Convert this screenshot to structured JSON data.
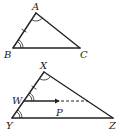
{
  "diagram": {
    "triangle1": {
      "vertices": {
        "A": "A",
        "B": "B",
        "C": "C"
      },
      "marks": {
        "angle_A": "single-arc",
        "angle_B": "double-arc",
        "side_AB": "tick"
      }
    },
    "triangle2": {
      "vertices": {
        "X": "X",
        "Y": "Y",
        "Z": "Z"
      },
      "points": {
        "W": "W",
        "P": "P"
      },
      "marks": {
        "angle_X": "single-arc",
        "angle_W": "double-arc",
        "angle_Y": "double-arc",
        "side_XW": "tick",
        "segment_WP": "arrow",
        "extension_P": "dashed"
      }
    }
  }
}
